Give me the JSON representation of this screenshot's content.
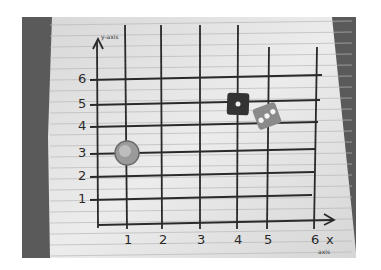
{
  "image": {
    "description": "Photo of a hand-drawn coordinate grid on lined paper with a coin and two dice placed on grid points",
    "y_axis_label": "y-axis",
    "x_axis_label": "x",
    "x_axis_sublabel": "axis",
    "x_ticks": [
      "1",
      "2",
      "3",
      "4",
      "5",
      "6"
    ],
    "y_ticks": [
      "1",
      "2",
      "3",
      "4",
      "5",
      "6"
    ],
    "objects": [
      {
        "name": "coin",
        "x": 1,
        "y": 3
      },
      {
        "name": "die-one-pip",
        "x": 4,
        "y": 5,
        "pips": 1
      },
      {
        "name": "die-three-pips",
        "x": 5,
        "y": 4.5,
        "pips": 3
      }
    ],
    "colors": {
      "paper": "#e4e4e4",
      "background": "#5a5a5a",
      "ink": "#2a2a2a"
    }
  }
}
